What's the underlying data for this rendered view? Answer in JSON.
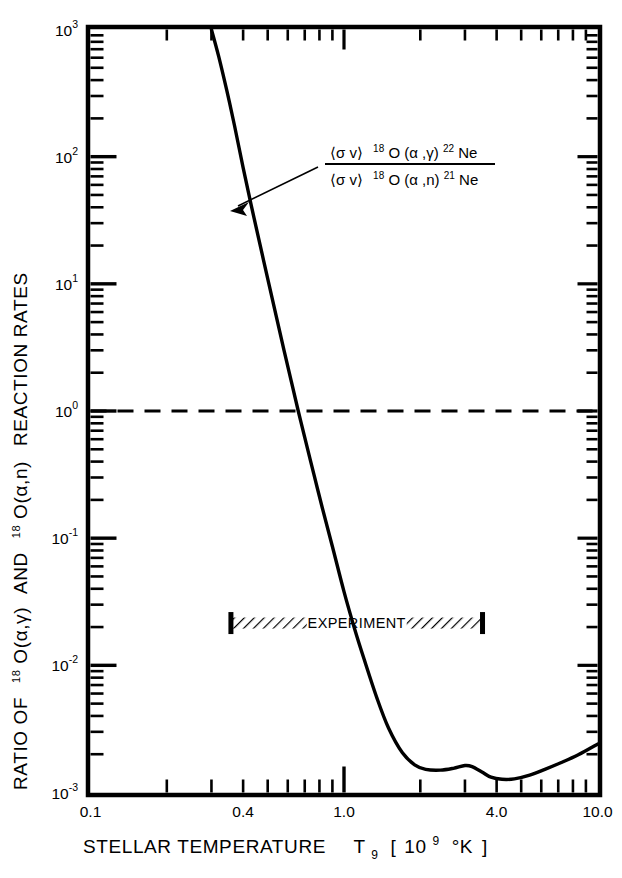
{
  "figure": {
    "background": "#ffffff",
    "ink": "#000000"
  },
  "chart_data": {
    "type": "line",
    "title": "",
    "subtitle": "",
    "xlabel": "STELLAR TEMPERATURE  T9 [ 109 °K ]",
    "xlabel_parts": {
      "main": "STELLAR TEMPERATURE",
      "symbol": "T",
      "symbol_sub": "9",
      "bracket_open": "[",
      "unit_base": "10",
      "unit_exp": "9",
      "unit_deg": "°K",
      "bracket_close": "]"
    },
    "ylabel": "RATIO OF 18O(α,γ) AND 18O(α,n) REACTION RATES",
    "ylabel_parts": {
      "lead": "RATIO OF",
      "iso1_sup": "18",
      "iso1": "O(α,γ)",
      "conj": "AND",
      "iso2_sup": "18",
      "iso2": "O(α,n)",
      "tail": "REACTION RATES"
    },
    "xscale": "log",
    "yscale": "log",
    "xlim": [
      0.1,
      10.0
    ],
    "ylim": [
      0.001,
      1000.0
    ],
    "grid": false,
    "legend": "none",
    "xticklabels": [
      {
        "value": 0.1,
        "text": "0.1"
      },
      {
        "value": 0.4,
        "text": "0.4"
      },
      {
        "value": 1.0,
        "text": "1.0"
      },
      {
        "value": 4.0,
        "text": "4.0"
      },
      {
        "value": 10.0,
        "text": "10.0"
      }
    ],
    "yticklabels": [
      {
        "value": 1000,
        "base": "10",
        "exp": "3"
      },
      {
        "value": 100,
        "base": "10",
        "exp": "2"
      },
      {
        "value": 10,
        "base": "10",
        "exp": "1"
      },
      {
        "value": 1,
        "base": "10",
        "exp": "0"
      },
      {
        "value": 0.1,
        "base": "10",
        "exp": "-1"
      },
      {
        "value": 0.01,
        "base": "10",
        "exp": "-2"
      },
      {
        "value": 0.001,
        "base": "10",
        "exp": "-3"
      }
    ],
    "series": [
      {
        "name": "ratio-curve",
        "style": "solid",
        "linewidth": 3.4,
        "points": [
          [
            0.3,
            1000
          ],
          [
            0.32,
            620
          ],
          [
            0.345,
            330
          ],
          [
            0.37,
            175
          ],
          [
            0.4,
            82
          ],
          [
            0.43,
            42
          ],
          [
            0.46,
            23
          ],
          [
            0.5,
            11.0
          ],
          [
            0.54,
            5.6
          ],
          [
            0.58,
            3.0
          ],
          [
            0.62,
            1.7
          ],
          [
            0.66,
            1.0
          ],
          [
            0.7,
            0.62
          ],
          [
            0.76,
            0.32
          ],
          [
            0.82,
            0.175
          ],
          [
            0.9,
            0.086
          ],
          [
            1.0,
            0.038
          ],
          [
            1.1,
            0.0195
          ],
          [
            1.2,
            0.0112
          ],
          [
            1.35,
            0.0055
          ],
          [
            1.5,
            0.0032
          ],
          [
            1.7,
            0.00205
          ],
          [
            1.9,
            0.00165
          ],
          [
            2.1,
            0.00152
          ],
          [
            2.4,
            0.0015
          ],
          [
            2.7,
            0.00155
          ],
          [
            3.0,
            0.00163
          ],
          [
            3.2,
            0.0016
          ],
          [
            3.5,
            0.00145
          ],
          [
            3.8,
            0.00132
          ],
          [
            4.2,
            0.00127
          ],
          [
            4.7,
            0.00128
          ],
          [
            5.4,
            0.00137
          ],
          [
            6.2,
            0.00152
          ],
          [
            7.2,
            0.00172
          ],
          [
            8.4,
            0.00198
          ],
          [
            10.0,
            0.0024
          ]
        ]
      }
    ],
    "reference_lines": [
      {
        "name": "unity-ratio-line",
        "orientation": "horizontal",
        "value": 1.0,
        "style": "dashed"
      }
    ],
    "annotations": [
      {
        "name": "ratio-formula",
        "type": "fraction",
        "numerator": {
          "bracket": "⟨σ v⟩",
          "sup": "18",
          "nuclide": "O (α ,γ)",
          "sup2": "22",
          "product": "Ne"
        },
        "denominator": {
          "bracket": "⟨σ v⟩",
          "sup": "18",
          "nuclide": "O (α ,n)",
          "sup2": "21",
          "product": "Ne"
        },
        "has_arrow": true
      },
      {
        "name": "experiment-band",
        "text": "EXPERIMENT",
        "x_start": 0.35,
        "x_end": 3.6,
        "y_value": 0.0215,
        "hatched": true
      }
    ]
  }
}
